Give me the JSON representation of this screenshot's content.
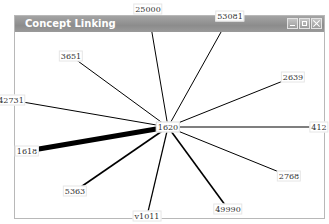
{
  "window": {
    "title": "Concept Linking",
    "buttons": [
      {
        "name": "minimize-button",
        "icon": "minimize-icon"
      },
      {
        "name": "maximize-button",
        "icon": "maximize-icon"
      },
      {
        "name": "close-button",
        "icon": "close-icon"
      }
    ]
  },
  "graph": {
    "center": {
      "label": "1620",
      "x": 167,
      "y": 126
    },
    "nodes": [
      {
        "label": "25000",
        "x": 147,
        "y": 8,
        "weight": 1
      },
      {
        "label": "53081",
        "x": 229,
        "y": 15,
        "weight": 1
      },
      {
        "label": "3651",
        "x": 70,
        "y": 55,
        "weight": 1
      },
      {
        "label": "2639",
        "x": 292,
        "y": 76,
        "weight": 1
      },
      {
        "label": "42731",
        "x": 10,
        "y": 99,
        "weight": 1
      },
      {
        "label": "412",
        "x": 318,
        "y": 126,
        "weight": 1.2
      },
      {
        "label": "1618",
        "x": 26,
        "y": 150,
        "weight": 5
      },
      {
        "label": "2768",
        "x": 288,
        "y": 175,
        "weight": 1
      },
      {
        "label": "5363",
        "x": 74,
        "y": 190,
        "weight": 1.6
      },
      {
        "label": "49990",
        "x": 227,
        "y": 208,
        "weight": 1.6
      },
      {
        "label": "v1011",
        "x": 146,
        "y": 215,
        "weight": 1.2
      }
    ]
  },
  "colors": {
    "titlebar": "#9a9a9a",
    "edge": "#000000",
    "border": "#b8b8b8"
  }
}
